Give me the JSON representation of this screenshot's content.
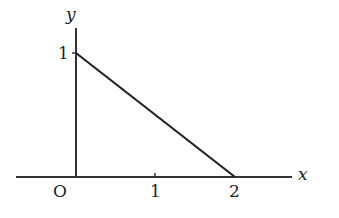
{
  "diagram": {
    "type": "coordinate-graph",
    "axes": {
      "x_label": "x",
      "y_label": "y",
      "origin_label": "O",
      "x_ticks": [
        {
          "value": 1,
          "label": "1"
        },
        {
          "value": 2,
          "label": "2"
        }
      ],
      "y_ticks": [
        {
          "value": 1,
          "label": "1"
        }
      ]
    },
    "segment": {
      "from": [
        0,
        1
      ],
      "to": [
        2,
        0
      ]
    },
    "colors": {
      "line": "#222222",
      "axis": "#333333",
      "background": "#ffffff"
    }
  }
}
